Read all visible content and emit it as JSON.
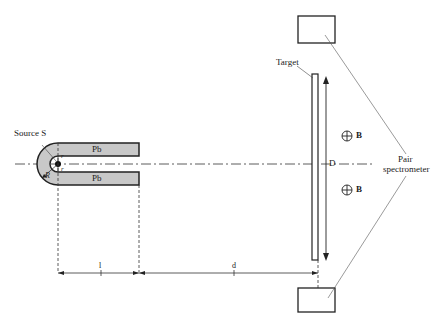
{
  "diagram": {
    "labels": {
      "source": "Source S",
      "pb_top": "Pb",
      "pb_bottom": "Pb",
      "r_small_top": "r",
      "r_small_bottom": "r",
      "R_radius": "R",
      "target": "Target",
      "D": "D",
      "B_top": "B",
      "B_bottom": "B",
      "pair_spectrometer_line1": "Pair",
      "pair_spectrometer_line2": "spectrometer",
      "dim_l": "l",
      "dim_d": "d"
    },
    "colors": {
      "lead_fill": "#c8c8c8",
      "stroke": "#222222",
      "background": "#ffffff"
    },
    "components": [
      {
        "name": "lead-shield",
        "material": "Pb",
        "shape": "U-shaped"
      },
      {
        "name": "source",
        "label": "Source S"
      },
      {
        "name": "target",
        "label": "Target"
      },
      {
        "name": "magnetic-field",
        "symbol": "⊕",
        "label": "B",
        "count": 2
      },
      {
        "name": "pair-spectrometer-detectors",
        "count": 2
      }
    ],
    "dimensions": [
      "l",
      "d",
      "D",
      "R",
      "r"
    ]
  }
}
